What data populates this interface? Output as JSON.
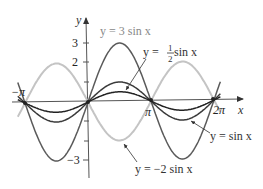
{
  "chart_data": {
    "type": "line",
    "title": "",
    "xlabel": "x",
    "ylabel": "y",
    "x_ticks": [
      "−π",
      "π",
      "2π"
    ],
    "y_ticks": [
      "3",
      "2",
      "−3"
    ],
    "xlim": [
      -3.6,
      6.9
    ],
    "ylim": [
      -3.5,
      3.6
    ],
    "grid": false,
    "legend_position": "inline annotations",
    "series": [
      {
        "name": "y = 3 sin x",
        "amplitude": 3,
        "color": "#555555",
        "x_range": [
          -3.5,
          6.6
        ]
      },
      {
        "name": "y = ½ sin x",
        "amplitude": 0.5,
        "color": "#222222",
        "x_range": [
          -3.5,
          6.6
        ]
      },
      {
        "name": "y = sin x",
        "amplitude": 1,
        "color": "#333333",
        "x_range": [
          -3.5,
          6.6
        ]
      },
      {
        "name": "y = −2 sin x",
        "amplitude": -2,
        "color": "#bbbbbb",
        "x_range": [
          -3.5,
          6.6
        ]
      }
    ]
  },
  "labels": {
    "y_axis": "y",
    "x_axis": "x",
    "tick_neg_pi": "−π",
    "tick_pi": "π",
    "tick_2pi": "2π",
    "tick_3": "3",
    "tick_2": "2",
    "tick_neg3": "−3",
    "curve_3sin": "y = 3 sin x",
    "curve_half_prefix": "y = ",
    "curve_half_num": "1",
    "curve_half_den": "2",
    "curve_half_suffix": " sin x",
    "curve_sin": "y = sin x",
    "curve_neg2sin": "y = −2 sin x"
  }
}
